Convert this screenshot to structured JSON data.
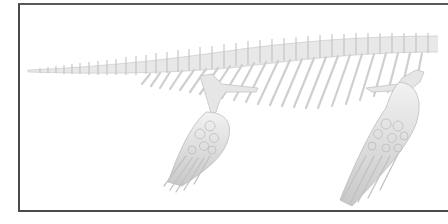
{
  "figure": {
    "colors": {
      "background": "#ffffff",
      "frame_border": "#4a4a4a",
      "bone_light": "#eeeeee",
      "bone_mid": "#d4d4d4",
      "bone_shadow": "#b0b0b0"
    },
    "parts": [
      "tail",
      "vertebral-column",
      "ribs",
      "hind-flipper",
      "fore-flipper"
    ]
  }
}
